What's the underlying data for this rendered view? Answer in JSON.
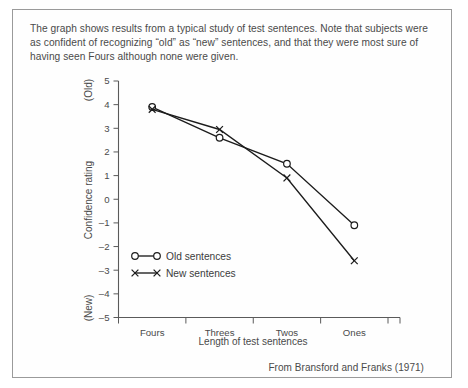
{
  "figure": {
    "caption": "The graph shows results from a typical study of test sentences. Note that subjects were as confident of recognizing “old” as “new” sentences, and that they were most sure of having seen Fours although none were given.",
    "source_note": "From Bransford and Franks (1971)",
    "frame_color": "#9a9a9a",
    "ink_color": "#1c1c1c"
  },
  "chart_data": {
    "type": "line",
    "title": "",
    "xlabel": "Length of test sentences",
    "ylabel": "Confidence rating",
    "categories": [
      "Fours",
      "Threes",
      "Twos",
      "Ones"
    ],
    "ylim": [
      -5,
      5
    ],
    "yticks": [
      5,
      4,
      3,
      2,
      1,
      0,
      -1,
      -2,
      -3,
      -4,
      -5
    ],
    "ytick_labels": [
      "5",
      "4",
      "3",
      "2",
      "1",
      "0",
      "–1",
      "–2",
      "–3",
      "–4",
      "–5"
    ],
    "y_axis_pole_top": "(Old)",
    "y_axis_pole_bottom": "(New)",
    "grid": false,
    "legend_position": "lower-left-inside",
    "series": [
      {
        "name": "Old sentences",
        "marker": "open-circle",
        "values": [
          3.9,
          2.6,
          1.5,
          -1.1
        ]
      },
      {
        "name": "New sentences",
        "marker": "cross",
        "values": [
          3.8,
          2.95,
          0.9,
          -2.6
        ]
      }
    ]
  },
  "legend": {
    "items": [
      {
        "label": "Old sentences",
        "marker": "open-circle"
      },
      {
        "label": "New sentences",
        "marker": "cross"
      }
    ]
  }
}
